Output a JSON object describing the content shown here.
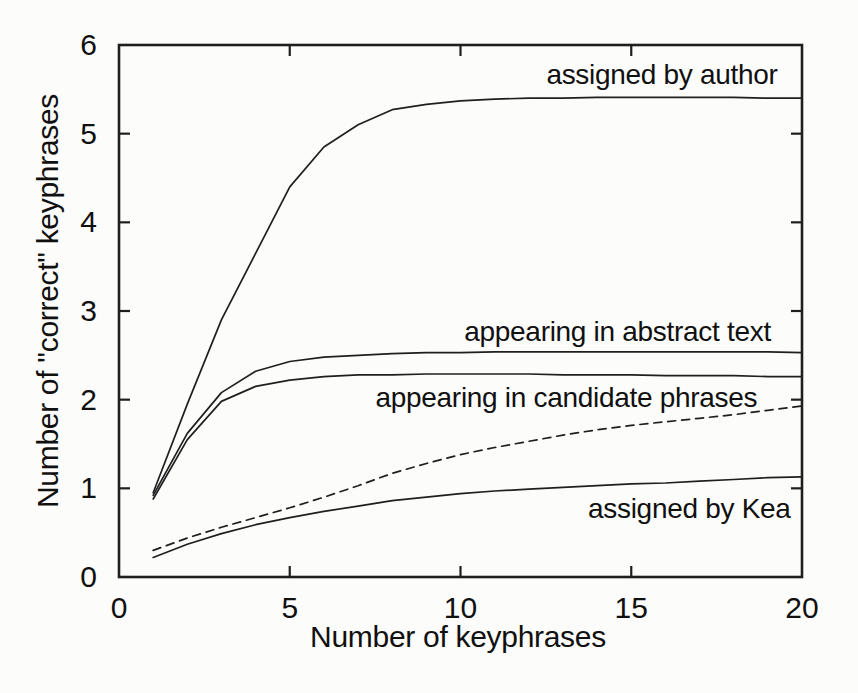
{
  "chart_data": {
    "type": "line",
    "title": "",
    "xlabel": "Number of keyphrases",
    "ylabel": "Number of \"correct\" keyphrases",
    "xlim": [
      0,
      20
    ],
    "ylim": [
      0,
      6
    ],
    "x_ticks": [
      0,
      5,
      10,
      15,
      20
    ],
    "y_ticks": [
      0,
      1,
      2,
      3,
      4,
      5,
      6
    ],
    "grid": false,
    "legend": "none",
    "x": [
      1,
      2,
      3,
      4,
      5,
      6,
      7,
      8,
      9,
      10,
      11,
      12,
      13,
      14,
      15,
      16,
      17,
      18,
      19,
      20
    ],
    "series": [
      {
        "id": "assigned-by-author",
        "label": "assigned by author",
        "line_style": "solid",
        "values": [
          0.95,
          1.95,
          2.9,
          3.65,
          4.4,
          4.85,
          5.1,
          5.27,
          5.33,
          5.37,
          5.39,
          5.4,
          5.4,
          5.41,
          5.41,
          5.41,
          5.41,
          5.41,
          5.4,
          5.4
        ]
      },
      {
        "id": "appearing-in-abstract-text",
        "label": "appearing in abstract text",
        "line_style": "solid",
        "values": [
          0.92,
          1.62,
          2.08,
          2.32,
          2.43,
          2.48,
          2.5,
          2.52,
          2.53,
          2.53,
          2.54,
          2.54,
          2.54,
          2.54,
          2.54,
          2.54,
          2.54,
          2.54,
          2.54,
          2.53
        ]
      },
      {
        "id": "appearing-in-candidate-phrases",
        "label": "appearing in candidate phrases",
        "line_style": "solid",
        "values": [
          0.88,
          1.55,
          1.98,
          2.15,
          2.22,
          2.26,
          2.28,
          2.28,
          2.29,
          2.29,
          2.29,
          2.29,
          2.28,
          2.28,
          2.28,
          2.27,
          2.27,
          2.27,
          2.26,
          2.26
        ]
      },
      {
        "id": "unlabeled-dashed-curve",
        "label": "",
        "line_style": "dashed",
        "values": [
          0.3,
          0.44,
          0.56,
          0.67,
          0.78,
          0.9,
          1.03,
          1.17,
          1.28,
          1.38,
          1.46,
          1.53,
          1.6,
          1.66,
          1.71,
          1.75,
          1.79,
          1.83,
          1.88,
          1.93
        ]
      },
      {
        "id": "assigned-by-kea",
        "label": "assigned by Kea",
        "line_style": "solid",
        "values": [
          0.22,
          0.37,
          0.49,
          0.59,
          0.67,
          0.74,
          0.8,
          0.86,
          0.9,
          0.94,
          0.97,
          0.99,
          1.01,
          1.03,
          1.05,
          1.06,
          1.08,
          1.1,
          1.12,
          1.13
        ]
      }
    ],
    "annotations": [
      {
        "text": "assigned by author",
        "x": 15.9,
        "y": 5.66
      },
      {
        "text": "appearing in abstract text",
        "x": 14.6,
        "y": 2.76
      },
      {
        "text": "appearing in candidate phrases",
        "x": 13.1,
        "y": 2.02
      },
      {
        "text": "assigned by Kea",
        "x": 16.7,
        "y": 0.77
      }
    ],
    "colors": {
      "line": "#1f1f1f",
      "text": "#101010",
      "background": "#fcfcfb"
    }
  }
}
